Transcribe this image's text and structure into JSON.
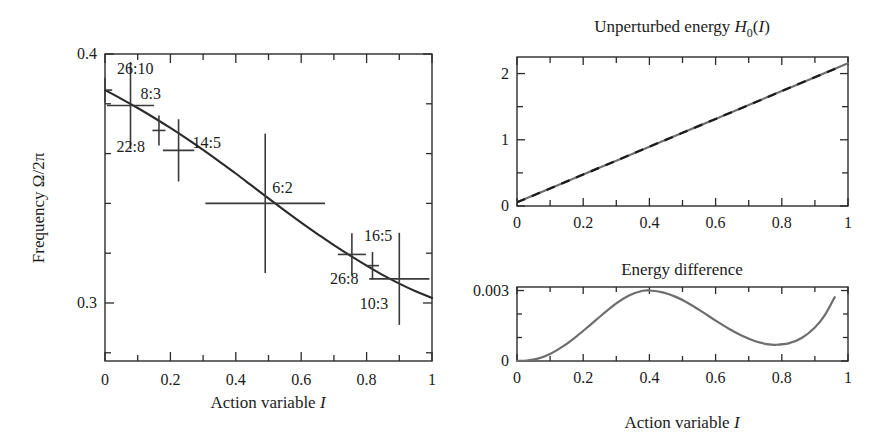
{
  "figure": {
    "panels": [
      {
        "id": "frequency-panel",
        "title": "",
        "xlabel_prefix": "Action variable ",
        "xlabel_symbol": "I",
        "ylabel_text": "Frequency Ω/2π",
        "x_ticks": [
          "0",
          "0.2",
          "0.4",
          "0.6",
          "0.8",
          "1"
        ],
        "y_ticks": [
          "0.4",
          "0.3"
        ]
      },
      {
        "id": "unperturbed-energy-panel",
        "title_prefix": "Unperturbed energy ",
        "title_symbol": "H",
        "title_subscript": "0",
        "title_suffix_open": "(",
        "title_arg": "I",
        "title_suffix_close": ")",
        "x_ticks": [
          "0",
          "0.2",
          "0.4",
          "0.6",
          "0.8",
          "1"
        ],
        "y_ticks": [
          "0",
          "1",
          "2"
        ]
      },
      {
        "id": "energy-difference-panel",
        "title": "Energy difference",
        "xlabel_prefix": "Action variable ",
        "xlabel_symbol": "I",
        "x_ticks": [
          "0",
          "0.2",
          "0.4",
          "0.6",
          "0.8",
          "1"
        ],
        "y_ticks": [
          "0",
          "0.003"
        ]
      }
    ]
  },
  "chart_data": [
    {
      "type": "line",
      "id": "frequency-vs-action",
      "title": "",
      "xlabel": "Action variable I",
      "ylabel": "Frequency Ω/2π",
      "xlim": [
        0,
        1
      ],
      "ylim": [
        0.2767,
        0.4
      ],
      "grid": false,
      "legend": "none",
      "x_tick_values": [
        0,
        0.1,
        0.2,
        0.3,
        0.4,
        0.5,
        0.6,
        0.7,
        0.8,
        0.9,
        1
      ],
      "x_tick_labels": [
        "0",
        "",
        "0.2",
        "",
        "0.4",
        "",
        "0.6",
        "",
        "0.8",
        "",
        "1"
      ],
      "y_tick_values": [
        0.4,
        0.38,
        0.36,
        0.34,
        0.32,
        0.3,
        0.28
      ],
      "y_tick_labels": [
        "0.4",
        "",
        "",
        "",
        "",
        "0.3",
        ""
      ],
      "curve": {
        "name": "Frequency curve",
        "x": [
          0.0,
          0.05,
          0.1,
          0.15,
          0.2,
          0.25,
          0.3,
          0.35,
          0.4,
          0.45,
          0.5,
          0.55,
          0.6,
          0.65,
          0.7,
          0.75,
          0.8,
          0.85,
          0.9,
          0.95,
          1.0
        ],
        "y": [
          0.3855,
          0.382,
          0.3783,
          0.3744,
          0.3703,
          0.366,
          0.3615,
          0.3568,
          0.352,
          0.347,
          0.342,
          0.3371,
          0.3323,
          0.3277,
          0.3232,
          0.319,
          0.315,
          0.3112,
          0.3078,
          0.3047,
          0.302
        ]
      },
      "resonance_points": [
        {
          "label": "26:10",
          "x": 0.0,
          "y": 0.3855,
          "xerr": 0.022,
          "yerr": 0.005
        },
        {
          "label": "8:3",
          "x": 0.078,
          "y": 0.3793,
          "xerr": 0.072,
          "yerr": 0.0175
        },
        {
          "label": "22:8",
          "x": 0.165,
          "y": 0.3693,
          "xerr": 0.02,
          "yerr": 0.006
        },
        {
          "label": "14:5",
          "x": 0.225,
          "y": 0.3613,
          "xerr": 0.048,
          "yerr": 0.0125
        },
        {
          "label": "6:2",
          "x": 0.49,
          "y": 0.34,
          "xerr": 0.183,
          "yerr": 0.028
        },
        {
          "label": "16:5",
          "x": 0.755,
          "y": 0.3195,
          "xerr": 0.043,
          "yerr": 0.0085
        },
        {
          "label": "26:8",
          "x": 0.818,
          "y": 0.315,
          "xerr": 0.02,
          "yerr": 0.0055
        },
        {
          "label": "10:3",
          "x": 0.9,
          "y": 0.3097,
          "xerr": 0.092,
          "yerr": 0.0185
        }
      ]
    },
    {
      "type": "line",
      "id": "unperturbed-energy",
      "title": "Unperturbed energy H0(I)",
      "xlabel": "Action variable I",
      "ylabel": "",
      "xlim": [
        0,
        1
      ],
      "ylim": [
        0,
        2.25
      ],
      "grid": false,
      "legend": "none",
      "x_tick_values": [
        0,
        0.1,
        0.2,
        0.3,
        0.4,
        0.5,
        0.6,
        0.7,
        0.8,
        0.9,
        1
      ],
      "x_tick_labels": [
        "0",
        "",
        "0.2",
        "",
        "0.4",
        "",
        "0.6",
        "",
        "0.8",
        "",
        "1"
      ],
      "y_tick_values": [
        0,
        0.5,
        1,
        1.5,
        2
      ],
      "y_tick_labels": [
        "0",
        "",
        "1",
        "",
        "2"
      ],
      "series": [
        {
          "name": "solid",
          "style": "solid-gray",
          "x": [
            0.0,
            0.1,
            0.2,
            0.3,
            0.4,
            0.5,
            0.6,
            0.7,
            0.8,
            0.9,
            1.0
          ],
          "y": [
            0.055,
            0.265,
            0.475,
            0.685,
            0.895,
            1.105,
            1.315,
            1.525,
            1.735,
            1.945,
            2.155
          ]
        },
        {
          "name": "dashed",
          "style": "dashed-black",
          "x": [
            0.0,
            0.1,
            0.2,
            0.3,
            0.4,
            0.5,
            0.6,
            0.7,
            0.8,
            0.9,
            0.97
          ],
          "y": [
            0.055,
            0.265,
            0.475,
            0.685,
            0.895,
            1.105,
            1.315,
            1.525,
            1.735,
            1.945,
            2.09
          ]
        }
      ]
    },
    {
      "type": "line",
      "id": "energy-difference",
      "title": "Energy difference",
      "xlabel": "Action variable I",
      "ylabel": "",
      "xlim": [
        0,
        1
      ],
      "ylim": [
        0,
        0.00315
      ],
      "grid": false,
      "legend": "none",
      "x_tick_values": [
        0,
        0.1,
        0.2,
        0.3,
        0.4,
        0.5,
        0.6,
        0.7,
        0.8,
        0.9,
        1
      ],
      "x_tick_labels": [
        "0",
        "",
        "0.2",
        "",
        "0.4",
        "",
        "0.6",
        "",
        "0.8",
        "",
        "1"
      ],
      "y_tick_values": [
        0,
        0.001,
        0.002,
        0.003
      ],
      "y_tick_labels": [
        "0",
        "",
        "",
        "0.003"
      ],
      "curve": {
        "name": "Energy difference curve",
        "x": [
          0.0,
          0.03,
          0.06,
          0.1,
          0.14,
          0.18,
          0.22,
          0.26,
          0.3,
          0.34,
          0.38,
          0.4,
          0.44,
          0.48,
          0.52,
          0.56,
          0.6,
          0.64,
          0.68,
          0.72,
          0.76,
          0.78,
          0.82,
          0.86,
          0.9,
          0.93,
          0.96
        ],
        "y": [
          0.0,
          2e-05,
          9e-05,
          0.0003,
          0.00063,
          0.00105,
          0.00152,
          0.002,
          0.00245,
          0.0028,
          0.00299,
          0.003,
          0.00292,
          0.00273,
          0.00244,
          0.00209,
          0.00172,
          0.00137,
          0.00107,
          0.00084,
          0.00071,
          0.00069,
          0.00075,
          0.00098,
          0.00143,
          0.00195,
          0.00272
        ]
      }
    }
  ]
}
